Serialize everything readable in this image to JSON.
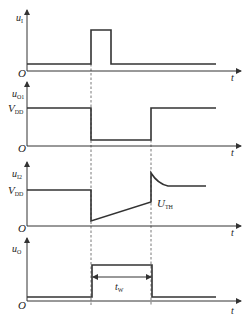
{
  "diagram": {
    "time_axis_label": "t",
    "origin_label": "O",
    "panels": [
      {
        "id": "u_I",
        "label_main": "u",
        "label_sub": "I",
        "level_labels": []
      },
      {
        "id": "u_O1",
        "label_main": "u",
        "label_sub": "O1",
        "level_labels": [
          {
            "main": "V",
            "sub": "DD"
          }
        ]
      },
      {
        "id": "u_I2",
        "label_main": "u",
        "label_sub": "I2",
        "level_labels": [
          {
            "main": "V",
            "sub": "DD"
          }
        ],
        "annotation": {
          "main": "U",
          "sub": "TH"
        }
      },
      {
        "id": "u_O",
        "label_main": "u",
        "label_sub": "O",
        "level_labels": [],
        "annotation": {
          "main": "t",
          "sub": "W"
        }
      }
    ],
    "colors": {
      "line": "#333333",
      "background": "#ffffff"
    }
  }
}
